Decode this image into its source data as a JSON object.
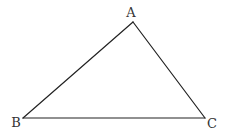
{
  "diagram": {
    "type": "triangle",
    "vertices": [
      {
        "label": "A",
        "x": 133,
        "y": 22,
        "label_x": 131,
        "label_y": 17
      },
      {
        "label": "B",
        "x": 23,
        "y": 118,
        "label_x": 16,
        "label_y": 127
      },
      {
        "label": "C",
        "x": 205,
        "y": 118,
        "label_x": 212,
        "label_y": 128
      }
    ],
    "edges": [
      [
        "A",
        "B"
      ],
      [
        "B",
        "C"
      ],
      [
        "C",
        "A"
      ]
    ],
    "stroke_color": "#222222",
    "background": "#ffffff"
  }
}
